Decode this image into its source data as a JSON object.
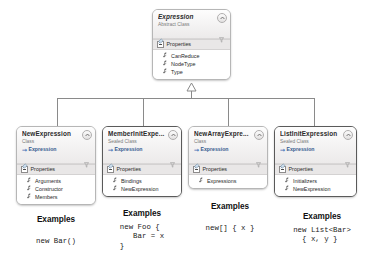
{
  "diagram": {
    "kind": "uml-class-diagram",
    "relationship": "inheritance",
    "colors": {
      "box_border": "#b6b6b6",
      "sealed_border": "#5a5a5a",
      "header_gradient_top": "#fdfdfd",
      "header_gradient_bottom": "#eceaea",
      "compartment_bg": "#e9e7e7",
      "base_type_text": "#35598f",
      "kind_text": "#7b7b7b",
      "connector": "#8a8a8a",
      "canvas": "#ffffff"
    },
    "icons": {
      "collapse": "chevron-up-icon",
      "base_type": "inheritance-arrow-icon",
      "pin": "pin-icon",
      "filter": "filter-icon",
      "expander": "collapse-expander-icon",
      "property": "wrench-icon"
    }
  },
  "base_class": {
    "name": "Expression",
    "kind": "Abstract Class",
    "compartment": "Properties",
    "members": [
      "CanReduce",
      "NodeType",
      "Type"
    ]
  },
  "derived_classes": [
    {
      "name": "NewExpression",
      "kind": "Class",
      "sealed": false,
      "base_type": "Expression",
      "compartment": "Properties",
      "members": [
        "Arguments",
        "Constructor",
        "Members"
      ],
      "example_title": "Examples",
      "example_code": "new Bar()"
    },
    {
      "name": "MemberInitExpe...",
      "kind": "Sealed Class",
      "sealed": true,
      "base_type": "Expression",
      "compartment": "Properties",
      "members": [
        "Bindings",
        "NewExpression"
      ],
      "example_title": "Examples",
      "example_code": "new Foo {\n   Bar = x\n}"
    },
    {
      "name": "NewArrayExpre...",
      "kind": "Class",
      "sealed": false,
      "base_type": "Expression",
      "compartment": "Properties",
      "members": [
        "Expressions"
      ],
      "example_title": "Examples",
      "example_code": "new[] { x }"
    },
    {
      "name": "ListInitExpression",
      "kind": "Sealed Class",
      "sealed": true,
      "base_type": "Expression",
      "compartment": "Properties",
      "members": [
        "Initializers",
        "NewExpression"
      ],
      "example_title": "Examples",
      "example_code": "new List<Bar>\n  { x, y }"
    }
  ]
}
